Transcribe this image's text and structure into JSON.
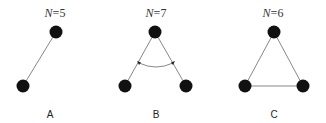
{
  "panels": [
    {
      "id": "A",
      "label": "A",
      "n_label": "N=5",
      "n_var": "N",
      "n_value": "=5",
      "nodes": [
        {
          "x": 56,
          "y": 32
        },
        {
          "x": 23,
          "y": 86
        }
      ],
      "edges": [
        [
          0,
          1
        ]
      ]
    },
    {
      "id": "B",
      "label": "B",
      "n_label": "N=7",
      "n_var": "N",
      "n_value": "=7",
      "nodes": [
        {
          "x": 155,
          "y": 32
        },
        {
          "x": 125,
          "y": 86
        },
        {
          "x": 186,
          "y": 86
        }
      ],
      "edges": [
        [
          0,
          1
        ],
        [
          0,
          2
        ]
      ],
      "angle_arc": true
    },
    {
      "id": "C",
      "label": "C",
      "n_label": "N=6",
      "n_var": "N",
      "n_value": "=6",
      "nodes": [
        {
          "x": 274,
          "y": 32
        },
        {
          "x": 245,
          "y": 86
        },
        {
          "x": 303,
          "y": 86
        }
      ],
      "edges": [
        [
          0,
          1
        ],
        [
          0,
          2
        ],
        [
          1,
          2
        ]
      ]
    }
  ],
  "colors": {
    "node": "#111111",
    "edge": "#888888",
    "text": "#333333"
  }
}
